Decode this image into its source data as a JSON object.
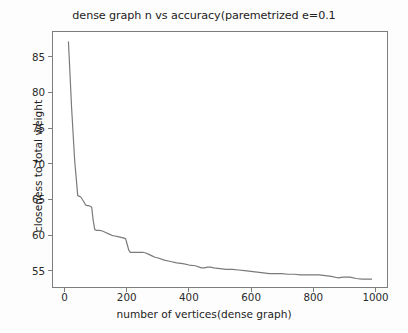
{
  "chart_data": {
    "type": "line",
    "title": "dense graph n vs accuracy(paremetrized e=0.1",
    "xlabel": "number of vertices(dense graph)",
    "ylabel": "closeness to total weight",
    "xlim": [
      -40,
      1040
    ],
    "ylim": [
      52.6,
      88.6
    ],
    "xticks": [
      0,
      200,
      400,
      600,
      800,
      1000
    ],
    "xticklabels": [
      "0",
      "200",
      "400",
      "600",
      "800",
      "1000"
    ],
    "yticks": [
      55,
      60,
      65,
      70,
      75,
      80,
      85
    ],
    "yticklabels": [
      "55",
      "60",
      "65",
      "70",
      "75",
      "80",
      "85"
    ],
    "grid": false,
    "legend": null,
    "line_color": "#7a7a7a",
    "line_width": 1.2,
    "series": [
      {
        "name": "closeness to total weight",
        "x": [
          10,
          20,
          30,
          40,
          50,
          60,
          65,
          70,
          75,
          80,
          85,
          90,
          95,
          100,
          110,
          120,
          130,
          140,
          150,
          160,
          170,
          180,
          190,
          195,
          200,
          205,
          210,
          220,
          230,
          240,
          250,
          260,
          270,
          280,
          290,
          300,
          320,
          340,
          360,
          380,
          400,
          420,
          440,
          450,
          460,
          470,
          480,
          500,
          520,
          540,
          560,
          580,
          600,
          620,
          640,
          660,
          680,
          700,
          720,
          740,
          760,
          780,
          800,
          820,
          840,
          860,
          880,
          900,
          920,
          940,
          960,
          980,
          990
        ],
        "y": [
          87.2,
          78.0,
          70.5,
          65.5,
          65.3,
          64.6,
          64.2,
          64.1,
          64.1,
          64.0,
          63.9,
          62.0,
          60.7,
          60.6,
          60.6,
          60.5,
          60.3,
          60.1,
          59.9,
          59.8,
          59.7,
          59.6,
          59.5,
          59.4,
          58.6,
          57.8,
          57.5,
          57.5,
          57.5,
          57.5,
          57.5,
          57.4,
          57.2,
          57.0,
          56.8,
          56.7,
          56.4,
          56.2,
          56.0,
          55.9,
          55.7,
          55.6,
          55.3,
          55.3,
          55.4,
          55.4,
          55.3,
          55.2,
          55.1,
          55.1,
          55.0,
          54.9,
          54.8,
          54.7,
          54.6,
          54.5,
          54.5,
          54.5,
          54.4,
          54.4,
          54.3,
          54.3,
          54.3,
          54.3,
          54.2,
          54.1,
          53.9,
          54.0,
          54.0,
          53.8,
          53.7,
          53.7,
          53.7
        ]
      }
    ]
  }
}
